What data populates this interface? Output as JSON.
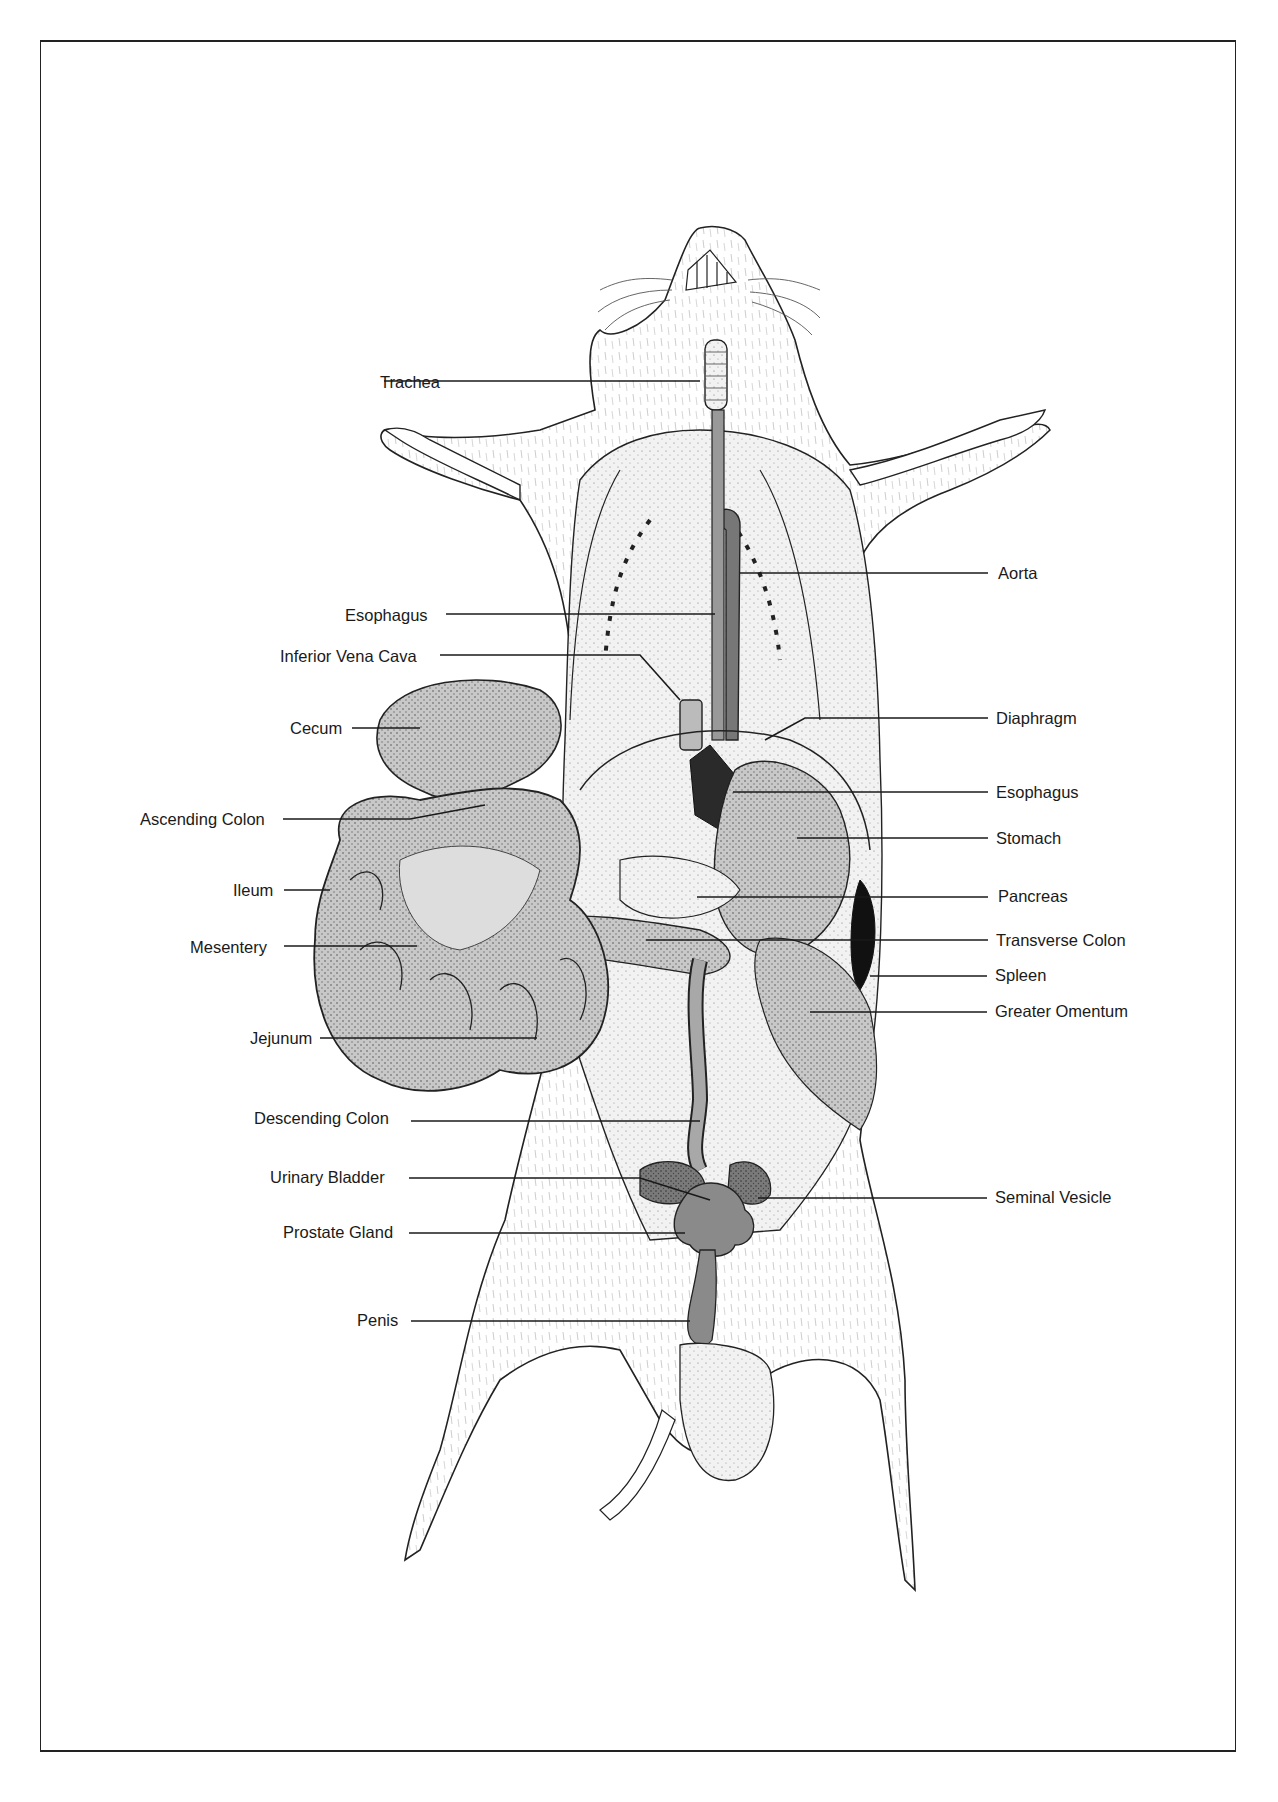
{
  "diagram": {
    "line_color": "#1a1a1a",
    "tissue_gray": "#a8a8a8",
    "dark_tissue": "#6a6a6a",
    "labels_left": [
      {
        "id": "trachea",
        "text": "Trachea",
        "x": 380,
        "y": 372,
        "lx1": 384,
        "lx2": 700,
        "ly": 381
      },
      {
        "id": "esophagus-upper",
        "text": "Esophagus",
        "x": 345,
        "y": 605,
        "lx1": 446,
        "lx2": 715,
        "ly": 614
      },
      {
        "id": "inferior-vena-cava",
        "text": "Inferior Vena Cava",
        "x": 280,
        "y": 646,
        "lx1": 440,
        "lx2": 640,
        "ly": 655,
        "bend": [
          680,
          700
        ]
      },
      {
        "id": "cecum",
        "text": "Cecum",
        "x": 290,
        "y": 718,
        "lx1": 352,
        "lx2": 420,
        "ly": 728
      },
      {
        "id": "ascending-colon",
        "text": "Ascending Colon",
        "x": 140,
        "y": 809,
        "lx1": 283,
        "lx2": 410,
        "ly": 819,
        "bend": [
          485,
          805
        ]
      },
      {
        "id": "ileum",
        "text": "Ileum",
        "x": 233,
        "y": 880,
        "lx1": 284,
        "lx2": 330,
        "ly": 890
      },
      {
        "id": "mesentery",
        "text": "Mesentery",
        "x": 190,
        "y": 937,
        "lx1": 284,
        "lx2": 417,
        "ly": 946
      },
      {
        "id": "jejunum",
        "text": "Jejunum",
        "x": 250,
        "y": 1028,
        "lx1": 320,
        "lx2": 537,
        "ly": 1038
      },
      {
        "id": "descending-colon",
        "text": "Descending Colon",
        "x": 254,
        "y": 1108,
        "lx1": 411,
        "lx2": 700,
        "ly": 1121
      },
      {
        "id": "urinary-bladder",
        "text": "Urinary Bladder",
        "x": 270,
        "y": 1167,
        "lx1": 409,
        "lx2": 640,
        "ly": 1178,
        "bend": [
          710,
          1200
        ]
      },
      {
        "id": "prostate-gland",
        "text": "Prostate Gland",
        "x": 283,
        "y": 1222,
        "lx1": 409,
        "lx2": 685,
        "ly": 1233
      },
      {
        "id": "penis",
        "text": "Penis",
        "x": 357,
        "y": 1310,
        "lx1": 411,
        "lx2": 690,
        "ly": 1321
      }
    ],
    "labels_right": [
      {
        "id": "aorta",
        "text": "Aorta",
        "x": 998,
        "y": 563,
        "lx1": 740,
        "lx2": 988,
        "ly": 573
      },
      {
        "id": "diaphragm",
        "text": "Diaphragm",
        "x": 996,
        "y": 708,
        "lx1": 805,
        "lx2": 988,
        "ly": 718,
        "bend": [
          765,
          740
        ]
      },
      {
        "id": "esophagus-lower",
        "text": "Esophagus",
        "x": 996,
        "y": 782,
        "lx1": 733,
        "lx2": 988,
        "ly": 792
      },
      {
        "id": "stomach",
        "text": "Stomach",
        "x": 996,
        "y": 828,
        "lx1": 797,
        "lx2": 988,
        "ly": 838
      },
      {
        "id": "pancreas",
        "text": "Pancreas",
        "x": 998,
        "y": 886,
        "lx1": 697,
        "lx2": 988,
        "ly": 897
      },
      {
        "id": "transverse-colon",
        "text": "Transverse Colon",
        "x": 996,
        "y": 930,
        "lx1": 646,
        "lx2": 988,
        "ly": 940
      },
      {
        "id": "spleen",
        "text": "Spleen",
        "x": 995,
        "y": 965,
        "lx1": 870,
        "lx2": 987,
        "ly": 976
      },
      {
        "id": "greater-omentum",
        "text": "Greater Omentum",
        "x": 995,
        "y": 1001,
        "lx1": 810,
        "lx2": 987,
        "ly": 1012
      },
      {
        "id": "seminal-vesicle",
        "text": "Seminal Vesicle",
        "x": 995,
        "y": 1187,
        "lx1": 758,
        "lx2": 987,
        "ly": 1198
      }
    ]
  }
}
